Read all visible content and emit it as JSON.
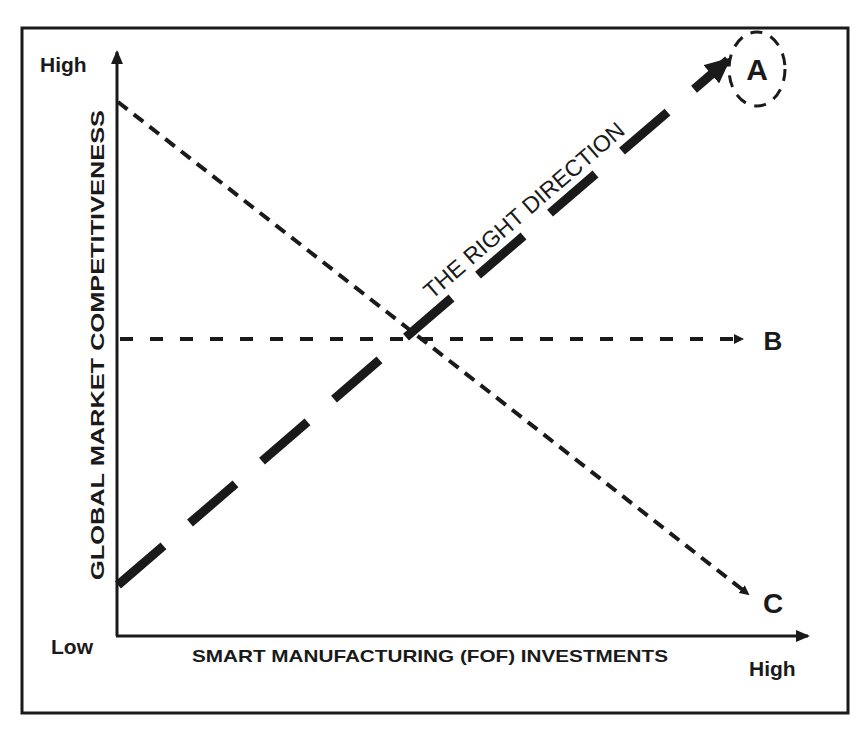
{
  "diagram": {
    "y_axis": {
      "title": "GLOBAL MARKET COMPETITIVENESS",
      "high_label": "High",
      "low_label": "Low"
    },
    "x_axis": {
      "title": "SMART MANUFACTURING (FOF) INVESTMENTS",
      "high_label": "High"
    },
    "paths": [
      {
        "id": "A",
        "label": "A",
        "style": "thick-dashed",
        "trend": "rising",
        "annotation": "THE RIGHT DIRECTION",
        "highlighted": true
      },
      {
        "id": "B",
        "label": "B",
        "style": "thin-dashed",
        "trend": "flat"
      },
      {
        "id": "C",
        "label": "C",
        "style": "thin-dashed",
        "trend": "falling"
      }
    ],
    "colors": {
      "ink": "#1a1a1a",
      "background": "#ffffff",
      "bleed_text": "#ececec"
    }
  }
}
